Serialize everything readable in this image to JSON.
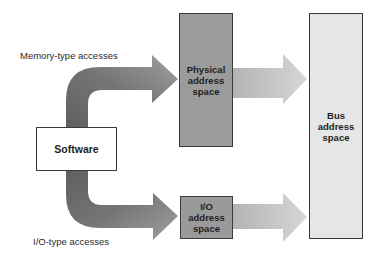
{
  "labels": {
    "memory_accesses": "Memory-type accesses",
    "io_accesses": "I/O-type accesses"
  },
  "boxes": {
    "software": "Software",
    "physical": "Physical\naddress\nspace",
    "io": "I/O\naddress\nspace",
    "bus": "Bus\naddress\nspace"
  },
  "colors": {
    "dark_arrow": "#6e6e6e",
    "light_arrow": "#c4c4c4",
    "physical_box": "#9b9b9b",
    "io_box": "#9a9a9a",
    "bus_box": "#e6e6e6",
    "border": "#3a3a3a"
  }
}
